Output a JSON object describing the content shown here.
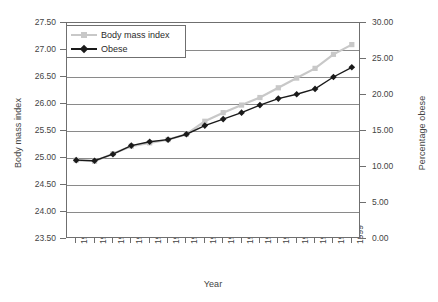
{
  "chart_data": {
    "type": "line",
    "title": "",
    "xlabel": "Year",
    "ylabel": "Body mass index",
    "ylabel_secondary": "Percentage obese",
    "categories": [
      1984,
      1985,
      1986,
      1987,
      1988,
      1989,
      1990,
      1991,
      1992,
      1993,
      1994,
      1995,
      1996,
      1997,
      1998,
      1999
    ],
    "x": [
      "1984",
      "1985",
      "1986",
      "1987",
      "1988",
      "1989",
      "1990",
      "1991",
      "1992",
      "1993",
      "1994",
      "1995",
      "1996",
      "1997",
      "1998",
      "1999"
    ],
    "ylim": [
      23.5,
      27.5
    ],
    "yticks": [
      "23.50",
      "24.00",
      "24.50",
      "25.00",
      "25.50",
      "26.00",
      "26.50",
      "27.00",
      "27.50"
    ],
    "ytick_values": [
      23.5,
      24.0,
      24.5,
      25.0,
      25.5,
      26.0,
      26.5,
      27.0,
      27.5
    ],
    "ylim_secondary": [
      0,
      30
    ],
    "yticks_secondary": [
      "0.00",
      "5.00",
      "10.00",
      "15.00",
      "20.00",
      "25.00",
      "30.00"
    ],
    "ytick_values_secondary": [
      0,
      5,
      10,
      15,
      20,
      25,
      30
    ],
    "grid": true,
    "legend_position": "top-left",
    "series": [
      {
        "name": "Body mass index",
        "axis": "left",
        "color": "#c8c8c8",
        "marker": "square",
        "values": [
          24.96,
          24.94,
          25.08,
          25.22,
          25.28,
          25.34,
          25.44,
          25.68,
          25.84,
          25.98,
          26.12,
          26.3,
          26.48,
          26.66,
          26.92,
          27.1
        ]
      },
      {
        "name": "Obese",
        "axis": "right",
        "color": "#1a1a1a",
        "marker": "diamond",
        "values_bmi_scale": [
          24.96,
          24.95,
          25.07,
          25.23,
          25.3,
          25.34,
          25.44,
          25.6,
          25.72,
          25.84,
          25.98,
          26.1,
          26.18,
          26.28,
          26.5,
          26.68
        ],
        "values": [
          11.0,
          10.9,
          11.8,
          13.0,
          13.5,
          13.8,
          14.6,
          15.8,
          16.7,
          17.6,
          18.6,
          19.5,
          20.1,
          20.9,
          22.5,
          23.8
        ]
      }
    ]
  }
}
